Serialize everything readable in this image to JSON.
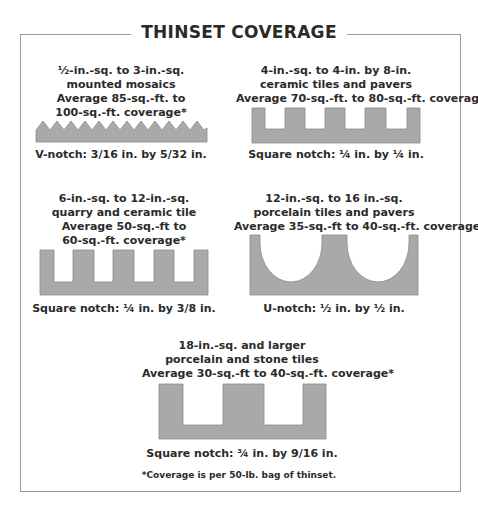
{
  "title": "THINSET COVERAGE",
  "colors": {
    "trowel_fill": "#a9a9a9",
    "trowel_stroke": "#8a8a8a",
    "frame": "#9a9a9a",
    "text": "#2a2a2a"
  },
  "panels": [
    {
      "id": "v-notch",
      "lines": [
        "½-in.-sq. to 3-in.-sq.",
        "mounted mosaics",
        "Average 85-sq.-ft. to",
        "100-sq.-ft. coverage*"
      ],
      "notch_type": "V-notch",
      "caption": "V-notch: 3/16 in. by 5/32 in."
    },
    {
      "id": "square-quarter-quarter",
      "lines": [
        "4-in.-sq. to 4-in. by 8-in.",
        "ceramic tiles and pavers",
        "Average 70-sq.-ft. to 80-sq.-ft. coverage*"
      ],
      "notch_type": "Square notch",
      "caption": "Square notch: ¼ in. by ¼ in."
    },
    {
      "id": "square-quarter-threeeighths",
      "lines": [
        "6-in.-sq. to 12-in.-sq.",
        "quarry and ceramic tile",
        "Average 50-sq.-ft to",
        "60-sq.-ft. coverage*"
      ],
      "notch_type": "Square notch",
      "caption": "Square notch: ¼ in. by 3/8 in."
    },
    {
      "id": "u-notch",
      "lines": [
        "12-in.-sq. to 16 in.-sq.",
        "porcelain tiles and pavers",
        "Average 35-sq.-ft to 40-sq.-ft. coverage*"
      ],
      "notch_type": "U-notch",
      "caption": "U-notch: ½ in. by ½ in."
    },
    {
      "id": "square-threequarter-ninesixteenths",
      "lines": [
        "18-in.-sq. and larger",
        "porcelain and stone tiles",
        "Average 30-sq.-ft to 40-sq.-ft. coverage*"
      ],
      "notch_type": "Square notch",
      "caption": "Square notch: ¾ in. by 9/16 in."
    }
  ],
  "footnote": "*Coverage is per 50-lb. bag of thinset."
}
